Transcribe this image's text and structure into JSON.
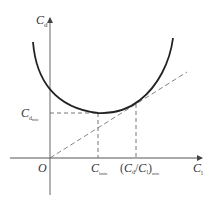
{
  "diagram": {
    "y_axis_label": {
      "main": "C",
      "sub": "d"
    },
    "x_axis_label": {
      "main": "C",
      "sub": "l"
    },
    "origin_label": "O",
    "cd_min_label": {
      "main": "C",
      "sub": "d",
      "subsub": "min"
    },
    "cl_min_label": {
      "main": "C",
      "sub": "lmin"
    },
    "ratio_min_label": {
      "open": "(",
      "num_main": "C",
      "num_sub": "d",
      "slash": "/",
      "den_main": "C",
      "den_sub": "l",
      "close": ")",
      "sub": "min"
    },
    "colors": {
      "curve": "#222222",
      "axis": "#555555",
      "dash": "#666666"
    }
  }
}
